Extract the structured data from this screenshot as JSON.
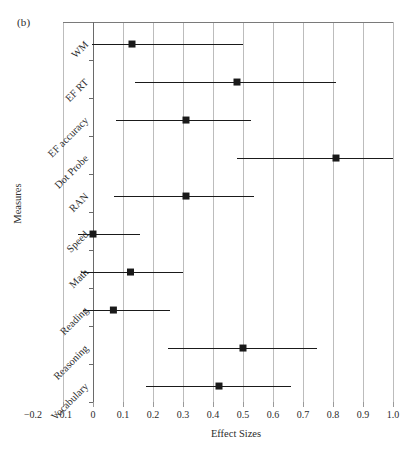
{
  "figure": {
    "panel_label": "(b)",
    "xlabel": "Effect Sizes",
    "ylabel": "Measures"
  },
  "chart_data": {
    "type": "scatter",
    "subtype": "forest-plot",
    "title": "",
    "panel_label": "(b)",
    "xlabel": "Effect Sizes",
    "ylabel": "Measures",
    "xlim": [
      -0.2,
      1.0
    ],
    "ylim_categories_top_to_bottom": true,
    "grid": true,
    "grid_axis": "x",
    "gridline_values": [
      -0.1,
      0,
      0.1,
      0.2,
      0.3,
      0.4,
      0.5,
      0.6,
      0.7,
      0.8,
      0.9,
      1.0
    ],
    "xticks": [
      -0.2,
      -0.1,
      0,
      0.1,
      0.2,
      0.3,
      0.4,
      0.5,
      0.6,
      0.7,
      0.8,
      0.9,
      1.0
    ],
    "xticklabels": [
      "−0.2",
      "−0.1",
      "0",
      "0.1",
      "0.2",
      "0.3",
      "0.4",
      "0.5",
      "0.6",
      "0.7",
      "0.8",
      "0.9",
      "1.0"
    ],
    "categories": [
      "WM",
      "EF RT",
      "EF accuracy",
      "Dot Probe",
      "RAN",
      "Speed",
      "Math",
      "Reading",
      "Reasoning",
      "Vocabulary"
    ],
    "marker": "square",
    "marker_color": "#1a1a1a",
    "line_color": "#1a1a1a",
    "points": [
      {
        "label": "WM",
        "value": 0.13,
        "ci_low": -0.005,
        "ci_high": 0.5
      },
      {
        "label": "EF RT",
        "value": 0.48,
        "ci_low": 0.14,
        "ci_high": 0.81
      },
      {
        "label": "EF accuracy",
        "value": 0.31,
        "ci_low": 0.075,
        "ci_high": 0.525
      },
      {
        "label": "Dot Probe",
        "value": 0.81,
        "ci_low": 0.48,
        "ci_high": 1.0
      },
      {
        "label": "RAN",
        "value": 0.31,
        "ci_low": 0.07,
        "ci_high": 0.535
      },
      {
        "label": "Speed",
        "value": 0.0,
        "ci_low": -0.05,
        "ci_high": 0.155
      },
      {
        "label": "Math",
        "value": 0.125,
        "ci_low": -0.04,
        "ci_high": 0.3
      },
      {
        "label": "Reading",
        "value": 0.068,
        "ci_low": -0.035,
        "ci_high": 0.255
      },
      {
        "label": "Reasoning",
        "value": 0.5,
        "ci_low": 0.25,
        "ci_high": 0.745
      },
      {
        "label": "Vocabulary",
        "value": 0.42,
        "ci_low": 0.175,
        "ci_high": 0.66
      }
    ]
  }
}
